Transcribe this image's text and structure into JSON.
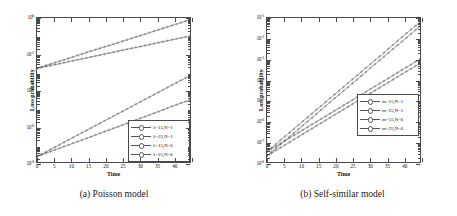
{
  "figure": {
    "panels": [
      {
        "id": "poisson",
        "caption": "(a) Poisson model",
        "chart_data": {
          "type": "line",
          "title": "",
          "xlabel": "Time",
          "ylabel": "Loss probability",
          "yscale": "log",
          "ylim": [
            1e-08,
            1
          ],
          "xlim": [
            0,
            45
          ],
          "grid": false,
          "legend_position": "lower right",
          "xticks": [
            0,
            5,
            10,
            15,
            20,
            25,
            30,
            35,
            40,
            45
          ],
          "xticklabels": [
            "0",
            "5",
            "10",
            "15",
            "20",
            "25",
            "30",
            "35",
            "40",
            ""
          ],
          "yticks": [
            1,
            0.01,
            0.0001,
            1e-06,
            1e-08
          ],
          "yticklabels": [
            "10",
            "10",
            "10",
            "10",
            "10"
          ],
          "ytickexponents": [
            "0",
            "-2",
            "-4",
            "-6",
            "-8"
          ],
          "x": [
            0,
            5,
            10,
            15,
            20,
            25,
            30,
            35,
            40,
            45
          ],
          "series": [
            {
              "name": "λ=15,N=1",
              "marker": "circle",
              "values": [
                2e-08,
                6.3e-08,
                2e-07,
                6.3e-07,
                2e-06,
                6.3e-06,
                2e-05,
                6.3e-05,
                0.0002,
                0.00063
              ]
            },
            {
              "name": "λ=25,N=1",
              "marker": "square",
              "values": [
                2e-08,
                4.5e-08,
                1e-07,
                2.2e-07,
                5e-07,
                1.1e-06,
                2.5e-06,
                5.6e-06,
                1.3e-05,
                2.8e-05
              ]
            },
            {
              "name": "λ=15,N=6",
              "marker": "diamond",
              "values": [
                0.0016,
                0.0032,
                0.0063,
                0.013,
                0.025,
                0.05,
                0.1,
                0.2,
                0.4,
                0.79
              ]
            },
            {
              "name": "λ=25,N=6",
              "marker": "triangle",
              "values": [
                0.0016,
                0.0025,
                0.004,
                0.0063,
                0.01,
                0.016,
                0.025,
                0.04,
                0.063,
                0.1
              ]
            }
          ]
        }
      },
      {
        "id": "self-similar",
        "caption": "(b) Self-similar model",
        "chart_data": {
          "type": "line",
          "title": "",
          "xlabel": "Time",
          "ylabel": "Loss probability",
          "yscale": "log",
          "ylim": [
            1e-08,
            0.1
          ],
          "xlim": [
            0,
            45
          ],
          "grid": false,
          "legend_position": "lower right",
          "xticks": [
            0,
            5,
            10,
            15,
            20,
            25,
            30,
            35,
            40,
            45
          ],
          "xticklabels": [
            "0",
            "5",
            "10",
            "15",
            "20",
            "25",
            "30",
            "35",
            "40",
            ""
          ],
          "yticks": [
            0.1,
            0.01,
            0.001,
            0.0001,
            1e-05,
            1e-06,
            1e-07,
            1e-08
          ],
          "yticklabels": [
            "10",
            "10",
            "10",
            "10",
            "10",
            "10",
            "10",
            "10"
          ],
          "ytickexponents": [
            "-1",
            "-2",
            "-3",
            "-4",
            "-5",
            "-6",
            "-7",
            "-8"
          ],
          "x": [
            0,
            5,
            10,
            15,
            20,
            25,
            30,
            35,
            40,
            45
          ],
          "series": [
            {
              "name": "m=15,N=1",
              "marker": "circle",
              "values": [
                3.2e-08,
                1.6e-07,
                7.9e-07,
                4e-06,
                2e-05,
                0.0001,
                0.0005,
                0.0025,
                0.013,
                0.063
              ]
            },
            {
              "name": "m=25,N=1",
              "marker": "square",
              "values": [
                2e-08,
                1e-07,
                5e-07,
                2.5e-06,
                1.3e-05,
                6.3e-05,
                0.00032,
                0.0016,
                0.0079,
                0.04
              ]
            },
            {
              "name": "m=15,N=6",
              "marker": "diamond",
              "values": [
                3.2e-08,
                1e-07,
                3.2e-07,
                1e-06,
                3.2e-06,
                1e-05,
                3.2e-05,
                0.0001,
                0.00032,
                0.001
              ]
            },
            {
              "name": "m=25,N=6",
              "marker": "triangle",
              "values": [
                2e-08,
                6.3e-08,
                2e-07,
                6.3e-07,
                2e-06,
                6.3e-06,
                2e-05,
                6.3e-05,
                0.0002,
                0.00063
              ]
            }
          ]
        }
      }
    ]
  }
}
